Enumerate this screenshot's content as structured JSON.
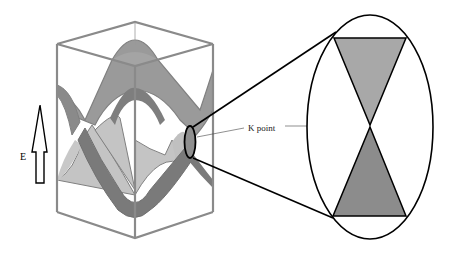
{
  "figure": {
    "axis_label": "E",
    "annotation": "K point",
    "colors": {
      "box_edge": "#8a8a8a",
      "upper_band": "#9a9a9a",
      "lower_band": "#7a7a7a",
      "light_band": "#c4c4c4",
      "outline": "#000000",
      "cone_upper": "#a8a8a8",
      "cone_lower": "#8c8c8c"
    }
  }
}
